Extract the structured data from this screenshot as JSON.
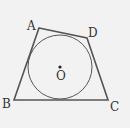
{
  "diagram": {
    "type": "geometry",
    "points": {
      "A": {
        "label": "A",
        "x": 39,
        "y": 28
      },
      "B": {
        "label": "B",
        "x": 14,
        "y": 100
      },
      "C": {
        "label": "C",
        "x": 108,
        "y": 100
      },
      "D": {
        "label": "D",
        "x": 87,
        "y": 38
      }
    },
    "circle": {
      "center_label": "O",
      "cx": 60,
      "cy": 67,
      "r": 32
    },
    "colors": {
      "stroke": "#555555",
      "background": "#f2f2f2"
    }
  }
}
